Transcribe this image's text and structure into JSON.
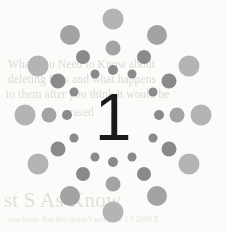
{
  "page": {
    "width": 226,
    "height": 231,
    "background_color": "#fbfbfa"
  },
  "numeral": {
    "label": "1",
    "color": "#1b1b1b",
    "center_x": 113,
    "center_y": 117
  },
  "palette": {
    "dot_light": "#b4b4b4",
    "dot_mid": "#a3a3a3",
    "dot_dark": "#8a8a8a",
    "ghost_text": "#d8d4cd",
    "numeral": "#1b1b1b",
    "background": "#fbfbfa"
  },
  "ghost_text": {
    "note": "faint bleed-through text from reverse side of the printed page",
    "lines": [
      {
        "text": "What You Need to Know about",
        "x": 8,
        "y": 58,
        "style": "body"
      },
      {
        "text": "deleting files and what happens",
        "x": 8,
        "y": 73,
        "style": "body"
      },
      {
        "text": "to them after you think it would be",
        "x": 6,
        "y": 88,
        "style": "body"
      },
      {
        "text": "erased",
        "x": 64,
        "y": 106,
        "style": "body"
      },
      {
        "text": "st S As Know",
        "x": 4,
        "y": 188,
        "style": "head"
      },
      {
        "text": "you know that this doesn't work x 1 2 3 2006 E",
        "x": 8,
        "y": 215,
        "style": "foot"
      }
    ]
  },
  "burst": {
    "type": "radial-dot-starburst",
    "center_x": 113,
    "center_y": 116,
    "arm_count": 8,
    "dots_per_arm": 3,
    "description": "Eight radial arms of grey circles growing larger toward the rim, surrounding a centred numeral.",
    "dots": [
      {
        "cx": 113,
        "cy": 19,
        "r": 10.5,
        "color": "#b4b4b4",
        "arm": "n",
        "rank": 3
      },
      {
        "cx": 113,
        "cy": 48,
        "r": 7.5,
        "color": "#a3a3a3",
        "arm": "n",
        "rank": 2
      },
      {
        "cx": 113,
        "cy": 70,
        "r": 5.0,
        "color": "#8a8a8a",
        "arm": "n",
        "rank": 1
      },
      {
        "cx": 113,
        "cy": 212,
        "r": 10.5,
        "color": "#b4b4b4",
        "arm": "s",
        "rank": 3
      },
      {
        "cx": 113,
        "cy": 184,
        "r": 7.5,
        "color": "#a3a3a3",
        "arm": "s",
        "rank": 2
      },
      {
        "cx": 113,
        "cy": 162,
        "r": 5.0,
        "color": "#8a8a8a",
        "arm": "s",
        "rank": 1
      },
      {
        "cx": 25,
        "cy": 115,
        "r": 10.5,
        "color": "#b4b4b4",
        "arm": "w",
        "rank": 3
      },
      {
        "cx": 49,
        "cy": 115,
        "r": 7.5,
        "color": "#a3a3a3",
        "arm": "w",
        "rank": 2
      },
      {
        "cx": 67,
        "cy": 115,
        "r": 5.0,
        "color": "#8a8a8a",
        "arm": "w",
        "rank": 1
      },
      {
        "cx": 201,
        "cy": 115,
        "r": 10.5,
        "color": "#b4b4b4",
        "arm": "e",
        "rank": 3
      },
      {
        "cx": 177,
        "cy": 115,
        "r": 7.5,
        "color": "#a3a3a3",
        "arm": "e",
        "rank": 2
      },
      {
        "cx": 159,
        "cy": 115,
        "r": 5.0,
        "color": "#8a8a8a",
        "arm": "e",
        "rank": 1
      },
      {
        "cx": 70,
        "cy": 35,
        "r": 10.0,
        "color": "#a3a3a3",
        "arm": "nw",
        "rank": 3
      },
      {
        "cx": 83,
        "cy": 57,
        "r": 7.0,
        "color": "#8a8a8a",
        "arm": "nw",
        "rank": 2
      },
      {
        "cx": 95,
        "cy": 74,
        "r": 4.5,
        "color": "#8a8a8a",
        "arm": "nw",
        "rank": 1
      },
      {
        "cx": 157,
        "cy": 35,
        "r": 10.0,
        "color": "#a3a3a3",
        "arm": "ne",
        "rank": 3
      },
      {
        "cx": 144,
        "cy": 57,
        "r": 7.0,
        "color": "#8a8a8a",
        "arm": "ne",
        "rank": 2
      },
      {
        "cx": 132,
        "cy": 74,
        "r": 4.5,
        "color": "#8a8a8a",
        "arm": "ne",
        "rank": 1
      },
      {
        "cx": 38,
        "cy": 66,
        "r": 10.5,
        "color": "#b4b4b4",
        "arm": "wnw",
        "rank": 3
      },
      {
        "cx": 58,
        "cy": 81,
        "r": 7.5,
        "color": "#8a8a8a",
        "arm": "wnw",
        "rank": 2
      },
      {
        "cx": 74,
        "cy": 92,
        "r": 4.5,
        "color": "#8a8a8a",
        "arm": "wnw",
        "rank": 1
      },
      {
        "cx": 189,
        "cy": 66,
        "r": 10.5,
        "color": "#b4b4b4",
        "arm": "ene",
        "rank": 3
      },
      {
        "cx": 169,
        "cy": 81,
        "r": 7.5,
        "color": "#8a8a8a",
        "arm": "ene",
        "rank": 2
      },
      {
        "cx": 153,
        "cy": 92,
        "r": 4.5,
        "color": "#8a8a8a",
        "arm": "ene",
        "rank": 1
      },
      {
        "cx": 38,
        "cy": 164,
        "r": 10.5,
        "color": "#b4b4b4",
        "arm": "wsw",
        "rank": 3
      },
      {
        "cx": 58,
        "cy": 149,
        "r": 7.5,
        "color": "#8a8a8a",
        "arm": "wsw",
        "rank": 2
      },
      {
        "cx": 74,
        "cy": 138,
        "r": 4.5,
        "color": "#8a8a8a",
        "arm": "wsw",
        "rank": 1
      },
      {
        "cx": 189,
        "cy": 164,
        "r": 10.5,
        "color": "#b4b4b4",
        "arm": "ese",
        "rank": 3
      },
      {
        "cx": 169,
        "cy": 149,
        "r": 7.5,
        "color": "#8a8a8a",
        "arm": "ese",
        "rank": 2
      },
      {
        "cx": 153,
        "cy": 138,
        "r": 4.5,
        "color": "#8a8a8a",
        "arm": "ese",
        "rank": 1
      },
      {
        "cx": 70,
        "cy": 196,
        "r": 10.0,
        "color": "#a3a3a3",
        "arm": "sw",
        "rank": 3
      },
      {
        "cx": 83,
        "cy": 174,
        "r": 7.0,
        "color": "#8a8a8a",
        "arm": "sw",
        "rank": 2
      },
      {
        "cx": 95,
        "cy": 157,
        "r": 4.5,
        "color": "#8a8a8a",
        "arm": "sw",
        "rank": 1
      },
      {
        "cx": 157,
        "cy": 196,
        "r": 10.0,
        "color": "#a3a3a3",
        "arm": "se",
        "rank": 3
      },
      {
        "cx": 144,
        "cy": 174,
        "r": 7.0,
        "color": "#8a8a8a",
        "arm": "se",
        "rank": 2
      },
      {
        "cx": 132,
        "cy": 157,
        "r": 4.5,
        "color": "#8a8a8a",
        "arm": "se",
        "rank": 1
      }
    ]
  }
}
